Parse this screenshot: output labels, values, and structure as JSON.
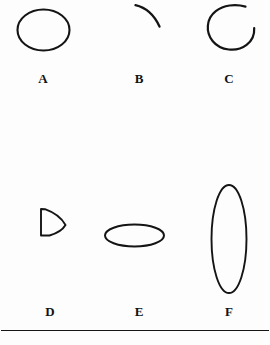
{
  "figure": {
    "background_color": "#fdfdfd",
    "ink_color": "#141414",
    "rule": {
      "name": "bottom-horizontal-rule",
      "visible": true
    },
    "rows": [
      {
        "row_index": 1,
        "items": [
          {
            "label": "A",
            "shape_name": "closed-circle-outline",
            "description": "closed circular outline"
          },
          {
            "label": "B",
            "shape_name": "short-arc",
            "description": "short open arc curving down to the right"
          },
          {
            "label": "C",
            "shape_name": "open-circle-with-gap",
            "description": "nearly closed circle with a gap at the upper right"
          }
        ]
      },
      {
        "row_index": 2,
        "items": [
          {
            "label": "D",
            "shape_name": "right-pointing-wedge",
            "description": "small triangular wedge pointing right"
          },
          {
            "label": "E",
            "shape_name": "wide-flat-ellipse",
            "description": "wide flattened horizontal ellipse"
          },
          {
            "label": "F",
            "shape_name": "tall-narrow-ellipse",
            "description": "tall narrow vertical ellipse"
          }
        ]
      }
    ]
  }
}
